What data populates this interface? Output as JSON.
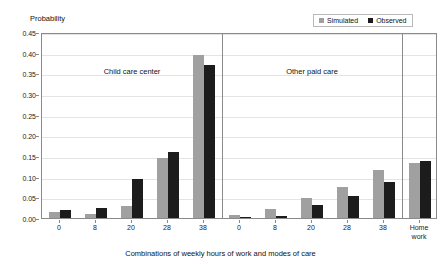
{
  "legend": {
    "entries": [
      {
        "label": "Simulated",
        "color": "#a0a0a0",
        "swatch_name": "legend-swatch-simulated"
      },
      {
        "label": "Observed",
        "color": "#1c1c1c",
        "swatch_name": "legend-swatch-observed"
      }
    ]
  },
  "chart_data": {
    "type": "bar",
    "title": "",
    "xlabel": "Combinations of weekly hours of work and modes of care",
    "ylabel": "Probability",
    "ylim": [
      0.0,
      0.45
    ],
    "ytick_values": [
      "0.45",
      "0.40",
      "0.35",
      "0.30",
      "0.25",
      "0.20",
      "0.15",
      "0.10",
      "0.05",
      "0.00"
    ],
    "ytick_step": 0.05,
    "grid": true,
    "legend_position": "top-right",
    "panels": [
      {
        "name": "Child care center",
        "categories": [
          "0",
          "8",
          "20",
          "28",
          "38"
        ],
        "series": [
          {
            "name": "Simulated",
            "values": [
              0.015,
              0.01,
              0.03,
              0.145,
              0.395
            ]
          },
          {
            "name": "Observed",
            "values": [
              0.02,
              0.025,
              0.095,
              0.16,
              0.37
            ]
          }
        ]
      },
      {
        "name": "Other paid care",
        "categories": [
          "0",
          "8",
          "20",
          "28",
          "38"
        ],
        "series": [
          {
            "name": "Simulated",
            "values": [
              0.008,
              0.023,
              0.048,
              0.075,
              0.115
            ]
          },
          {
            "name": "Observed",
            "values": [
              0.002,
              0.006,
              0.032,
              0.053,
              0.087
            ]
          }
        ]
      },
      {
        "name": "",
        "categories": [
          "Home work"
        ],
        "series": [
          {
            "name": "Simulated",
            "values": [
              0.133
            ]
          },
          {
            "name": "Observed",
            "values": [
              0.138
            ]
          }
        ]
      }
    ]
  }
}
